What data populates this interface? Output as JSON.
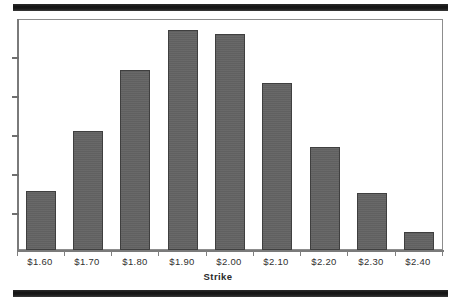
{
  "document": {
    "background_color": "#ffffff",
    "band_color": "#1a1a1a"
  },
  "chart_data": {
    "type": "bar",
    "title": "",
    "subtitle": "",
    "xlabel": "Strike",
    "ylabel": "",
    "categories": [
      "$1.60",
      "$1.70",
      "$1.80",
      "$1.90",
      "$2.00",
      "$2.10",
      "$2.20",
      "$2.30",
      "$2.40"
    ],
    "values": [
      27,
      54,
      82,
      100,
      98,
      76,
      47,
      26,
      8
    ],
    "ylim": [
      0,
      105
    ],
    "grid": false,
    "legend": null,
    "bar_color": "#636363",
    "bar_edge_color": "#3f3f3f",
    "y_axis_tick_count": 5,
    "y_axis_tick_labels": [],
    "annotations": []
  },
  "axes": {
    "x_tick_labels": [
      "$1.60",
      "$1.70",
      "$1.80",
      "$1.90",
      "$2.00",
      "$2.10",
      "$2.20",
      "$2.30",
      "$2.40"
    ],
    "x_axis_title": "Strike",
    "y_tick_labels": []
  }
}
